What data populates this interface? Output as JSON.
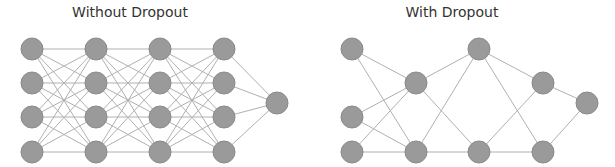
{
  "colors": {
    "background": "#ffffff",
    "node_fill": "#9a9a9a",
    "node_stroke": "#8a8a8a",
    "edge": "#b0b0b0",
    "title": "#333333"
  },
  "node_radius": 11,
  "panels": [
    {
      "title": "Without Dropout",
      "title_x": 130,
      "layers": [
        {
          "x": 32,
          "ys": [
            49,
            83,
            117,
            152
          ]
        },
        {
          "x": 96,
          "ys": [
            49,
            83,
            117,
            152
          ]
        },
        {
          "x": 160,
          "ys": [
            49,
            83,
            117,
            152
          ]
        },
        {
          "x": 224,
          "ys": [
            49,
            83,
            117,
            152
          ]
        },
        {
          "x": 277,
          "ys": [
            103
          ]
        }
      ],
      "fully_connected": true
    },
    {
      "title": "With Dropout",
      "title_x": 452,
      "nodes": [
        {
          "id": "a",
          "x": 352,
          "y": 49
        },
        {
          "id": "b",
          "x": 352,
          "y": 117
        },
        {
          "id": "c",
          "x": 352,
          "y": 152
        },
        {
          "id": "d",
          "x": 416,
          "y": 83
        },
        {
          "id": "e",
          "x": 416,
          "y": 152
        },
        {
          "id": "f",
          "x": 479,
          "y": 49
        },
        {
          "id": "g",
          "x": 479,
          "y": 152
        },
        {
          "id": "h",
          "x": 543,
          "y": 83
        },
        {
          "id": "i",
          "x": 543,
          "y": 152
        },
        {
          "id": "o",
          "x": 587,
          "y": 103
        }
      ],
      "edges": [
        [
          "a",
          "d"
        ],
        [
          "a",
          "e"
        ],
        [
          "b",
          "d"
        ],
        [
          "b",
          "e"
        ],
        [
          "c",
          "d"
        ],
        [
          "c",
          "e"
        ],
        [
          "d",
          "f"
        ],
        [
          "d",
          "g"
        ],
        [
          "e",
          "f"
        ],
        [
          "e",
          "g"
        ],
        [
          "f",
          "h"
        ],
        [
          "f",
          "i"
        ],
        [
          "g",
          "h"
        ],
        [
          "g",
          "i"
        ],
        [
          "h",
          "o"
        ],
        [
          "i",
          "o"
        ]
      ]
    }
  ]
}
